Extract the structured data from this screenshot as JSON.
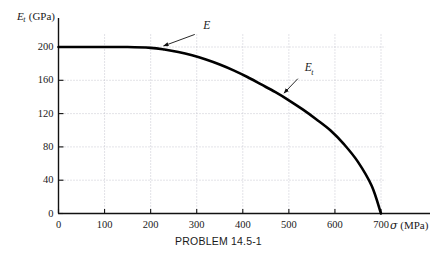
{
  "caption": "PROBLEM 14.5-1",
  "chart_data": {
    "type": "line",
    "title": "",
    "subtitle": "",
    "xlabel": "σ (MPa)",
    "ylabel": "E_t (GPa)",
    "ylabel_parts": {
      "symbol": "E",
      "subscript": "t",
      "unit": "(GPa)"
    },
    "xlabel_parts": {
      "symbol": "σ",
      "unit": "(MPa)"
    },
    "xlim": [
      0,
      740
    ],
    "ylim": [
      0,
      215
    ],
    "xticks": [
      0,
      100,
      200,
      300,
      400,
      500,
      600,
      700
    ],
    "yticks": [
      0,
      40,
      80,
      120,
      160,
      200
    ],
    "xtick_labels": [
      "0",
      "100",
      "200",
      "300",
      "400",
      "500",
      "600",
      "700"
    ],
    "ytick_labels": [
      "0",
      "40",
      "80",
      "120",
      "160",
      "200"
    ],
    "grid": true,
    "grid_style": "dotted",
    "legend": "none",
    "series": [
      {
        "name": "Tangent modulus curve",
        "color": "#000000",
        "linewidth": 2.6,
        "x": [
          0,
          50,
          100,
          150,
          200,
          230,
          260,
          290,
          320,
          350,
          380,
          410,
          440,
          470,
          500,
          530,
          560,
          590,
          620,
          650,
          680,
          700
        ],
        "y": [
          200,
          200,
          200,
          200,
          199,
          197,
          194,
          190,
          185,
          179,
          172,
          164,
          155,
          146,
          136,
          125,
          113,
          100,
          83,
          62,
          33,
          0
        ]
      }
    ],
    "annotations": [
      {
        "name": "E",
        "text": "E",
        "symbol": "E",
        "subscript": "",
        "label_x": 310,
        "label_y": 218,
        "point_x": 222,
        "point_y": 200
      },
      {
        "name": "Et",
        "text": "E_t",
        "symbol": "E",
        "subscript": "t",
        "label_x": 530,
        "label_y": 168,
        "point_x": 485,
        "point_y": 142
      }
    ]
  }
}
